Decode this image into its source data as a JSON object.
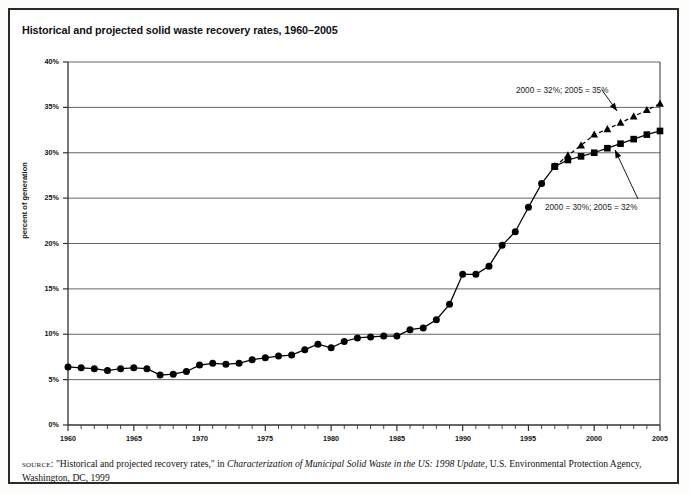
{
  "title": "Historical and projected solid waste recovery rates, 1960–2005",
  "source": {
    "label": "source",
    "part1": ": \"Historical and projected recovery rates,\" in ",
    "italic": "Characterization of Municipal Solid Waste in the US: 1998 Update",
    "part2": ", U.S. Environmental Protection Agency, Washington, DC, 1999"
  },
  "colors": {
    "frame": "#2b2b2b",
    "axis": "#333333",
    "grid": "#555555",
    "marker": "#000000",
    "background": "#ffffff"
  },
  "chart_data": {
    "type": "line",
    "title": "Historical and projected solid waste recovery rates, 1960–2005",
    "xlabel": "",
    "ylabel": "percent of generation",
    "xlim": [
      1960,
      2005
    ],
    "ylim": [
      0,
      40
    ],
    "ytick_labels": [
      "0%",
      "5%",
      "10%",
      "15%",
      "20%",
      "25%",
      "30%",
      "35%",
      "40%"
    ],
    "ytick_values": [
      0,
      5,
      10,
      15,
      20,
      25,
      30,
      35,
      40
    ],
    "xtick_labels": [
      "1960",
      "1965",
      "1970",
      "1975",
      "1980",
      "1985",
      "1990",
      "1995",
      "2000",
      "2005"
    ],
    "xtick_values": [
      1960,
      1965,
      1970,
      1975,
      1980,
      1985,
      1990,
      1995,
      2000,
      2005
    ],
    "minor_xticks_every": 1,
    "grid": "horizontal",
    "legend": "none",
    "series": [
      {
        "name": "historical",
        "marker": "circle",
        "linestyle": "solid",
        "x": [
          1960,
          1961,
          1962,
          1963,
          1964,
          1965,
          1966,
          1967,
          1968,
          1969,
          1970,
          1971,
          1972,
          1973,
          1974,
          1975,
          1976,
          1977,
          1978,
          1979,
          1980,
          1981,
          1982,
          1983,
          1984,
          1985,
          1986,
          1987,
          1988,
          1989,
          1990,
          1991,
          1992,
          1993,
          1994,
          1995,
          1996,
          1997
        ],
        "y": [
          6.4,
          6.3,
          6.2,
          6.0,
          6.2,
          6.3,
          6.2,
          5.5,
          5.6,
          5.9,
          6.6,
          6.8,
          6.7,
          6.8,
          7.2,
          7.4,
          7.6,
          7.7,
          8.3,
          8.9,
          8.5,
          9.2,
          9.6,
          9.7,
          9.8,
          9.8,
          10.5,
          10.7,
          11.6,
          13.3,
          16.6,
          16.6,
          17.5,
          19.8,
          21.3,
          24.0,
          26.6,
          28.5
        ]
      },
      {
        "name": "projection-high",
        "marker": "triangle",
        "linestyle": "dashed",
        "x": [
          1997,
          1998,
          1999,
          2000,
          2001,
          2002,
          2003,
          2004,
          2005
        ],
        "y": [
          28.5,
          29.7,
          30.8,
          32.0,
          32.6,
          33.3,
          34.0,
          34.7,
          35.4
        ]
      },
      {
        "name": "projection-low",
        "marker": "square",
        "linestyle": "solid",
        "x": [
          1997,
          1998,
          1999,
          2000,
          2001,
          2002,
          2003,
          2004,
          2005
        ],
        "y": [
          28.5,
          29.2,
          29.6,
          30.0,
          30.5,
          31.0,
          31.5,
          32.0,
          32.4
        ]
      }
    ],
    "annotations": [
      {
        "name": "projection-high-label",
        "text": "2000 = 32%; 2005 = 35%",
        "text_x": 516,
        "text_y": 86,
        "arrow_from_x": 602,
        "arrow_from_y": 90,
        "arrow_to_x": 617,
        "arrow_to_y": 111
      },
      {
        "name": "projection-low-label",
        "text": "2000 = 30%; 2005 = 32%",
        "text_x": 545,
        "text_y": 203,
        "arrow_from_x": 638,
        "arrow_from_y": 199,
        "arrow_to_x": 615,
        "arrow_to_y": 150
      }
    ]
  }
}
